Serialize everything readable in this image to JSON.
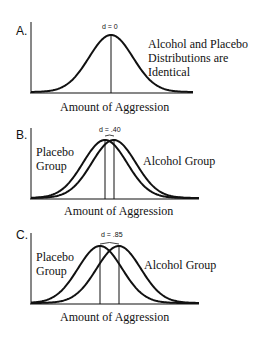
{
  "chart_data": [
    {
      "type": "line",
      "panel": "A.",
      "title": "",
      "xlabel": "Amount of Aggression",
      "ylabel": "",
      "effect_size_label": "d = 0",
      "annotation": [
        "Alcohol and Placebo",
        "Distributions are",
        "Identical"
      ],
      "series": [
        {
          "name": "Alcohol and Placebo (identical)",
          "mean": 0,
          "sd": 1
        }
      ],
      "grid": false
    },
    {
      "type": "line",
      "panel": "B.",
      "xlabel": "Amount of Aggression",
      "effect_size_label": "d = .40",
      "series": [
        {
          "name": "Placebo Group",
          "mean": 0,
          "sd": 1
        },
        {
          "name": "Alcohol Group",
          "mean": 0.4,
          "sd": 1
        }
      ],
      "grid": false
    },
    {
      "type": "line",
      "panel": "C.",
      "xlabel": "Amount of Aggression",
      "effect_size_label": "d = .85",
      "series": [
        {
          "name": "Placebo Group",
          "mean": 0,
          "sd": 1
        },
        {
          "name": "Alcohol Group",
          "mean": 0.85,
          "sd": 1
        }
      ],
      "grid": false
    }
  ],
  "panels": {
    "a": {
      "label": "A.",
      "d": "d = 0",
      "note1": "Alcohol and Placebo",
      "note2": "Distributions are",
      "note3": "Identical",
      "xlabel": "Amount of Aggression"
    },
    "b": {
      "label": "B.",
      "d": "d = .40",
      "placebo1": "Placebo",
      "placebo2": "Group",
      "alcohol": "Alcohol Group",
      "xlabel": "Amount of Aggression"
    },
    "c": {
      "label": "C.",
      "d": "d = .85",
      "placebo1": "Placebo",
      "placebo2": "Group",
      "alcohol": "Alcohol Group",
      "xlabel": "Amount of Aggression"
    }
  }
}
